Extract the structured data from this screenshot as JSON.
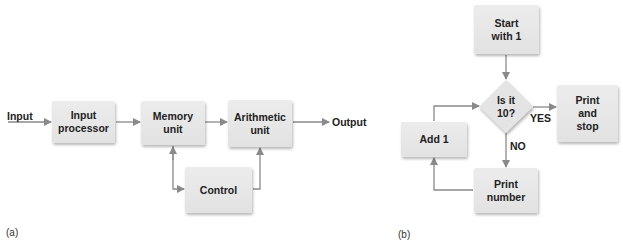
{
  "diagram_a": {
    "caption": "(a)",
    "input_label": "Input",
    "output_label": "Output",
    "boxes": {
      "input_processor": "Input\nprocessor",
      "memory_unit": "Memory\nunit",
      "arithmetic_unit": "Arithmetic\nunit",
      "control": "Control"
    }
  },
  "diagram_b": {
    "caption": "(b)",
    "boxes": {
      "start": "Start\nwith 1",
      "decision": "Is it\n10?",
      "print_and_stop": "Print\nand\nstop",
      "add_one": "Add 1",
      "print_number": "Print\nnumber"
    },
    "yes_label": "YES",
    "no_label": "NO"
  },
  "colors": {
    "box_fill": "#e4e4e4",
    "arrow": "#8a8a8a",
    "text": "#222222"
  }
}
